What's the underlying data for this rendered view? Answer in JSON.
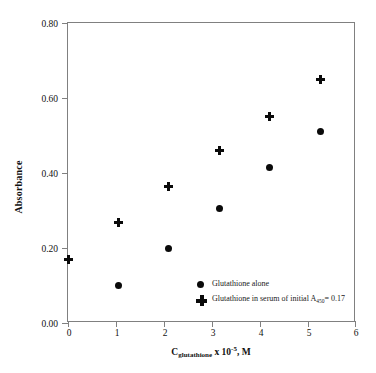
{
  "chart_data": {
    "type": "scatter",
    "title": "",
    "xlabel": "C_glutathione x 10^-5, M",
    "xlabel_parts": {
      "symbol": "C",
      "subscript": "glutathione",
      "multiplier": " x 10",
      "exponent": "-5",
      "units": ", M"
    },
    "ylabel": "Absorbance",
    "xlim": [
      0,
      6
    ],
    "ylim": [
      0.0,
      0.8
    ],
    "xticks": [
      "0",
      "1",
      "2",
      "3",
      "4",
      "5",
      "6"
    ],
    "xtick_values": [
      0,
      1,
      2,
      3,
      4,
      5,
      6
    ],
    "yticks": [
      "0.00",
      "0.20",
      "0.40",
      "0.60",
      "0.80"
    ],
    "ytick_values": [
      0.0,
      0.2,
      0.4,
      0.6,
      0.8
    ],
    "grid": false,
    "legend_position": "inside-bottom-right",
    "series": [
      {
        "name": "Glutathione alone",
        "marker": "circle",
        "color": "#0a0a0a",
        "x": [
          1.05,
          2.1,
          3.15,
          4.2,
          5.25
        ],
        "y": [
          0.1,
          0.2,
          0.305,
          0.415,
          0.51
        ]
      },
      {
        "name": "Glutathione in serum of initial A450= 0.17",
        "marker": "plus",
        "color": "#0a0a0a",
        "x": [
          0.0,
          1.05,
          2.1,
          3.15,
          4.2,
          5.25
        ],
        "y": [
          0.17,
          0.267,
          0.365,
          0.46,
          0.55,
          0.65
        ]
      }
    ]
  },
  "legend": {
    "items": [
      {
        "marker": "circle-marker",
        "label": "Glutathione alone",
        "label_prefix": "Glutathione alone",
        "subscript": "",
        "label_suffix": ""
      },
      {
        "marker": "plus-marker",
        "label": "Glutathione in serum of initial A450= 0.17",
        "label_prefix": "Glutathione in serum of initial A",
        "subscript": "450",
        "label_suffix": "= 0.17"
      }
    ]
  }
}
